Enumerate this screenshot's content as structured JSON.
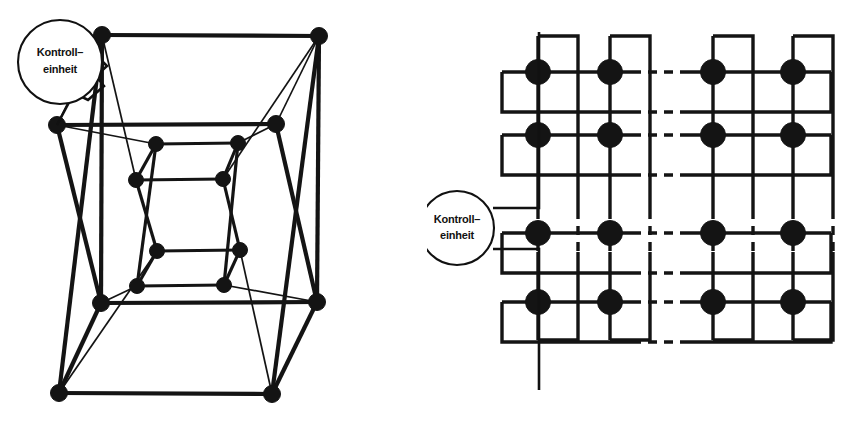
{
  "figure": {
    "background_color": "#ffffff",
    "ink_color": "#141414",
    "width": 854,
    "height": 422
  },
  "diagrams": [
    {
      "id": "hypercube",
      "name": "hypercube-diagram",
      "topology": "hypercube",
      "node_count": 16,
      "control_unit": {
        "label_line1": "Kontroll–",
        "label_line2": "einheit",
        "circle": {
          "cx": 60,
          "cy": 62,
          "r": 42
        },
        "text1": {
          "x": 60,
          "y": 53
        },
        "text2": {
          "x": 60,
          "y": 70
        },
        "leader_path": "M 98 57 L 107 66 L 96 76 L 104 86 L 88 100 L 74 93 L 57 125"
      },
      "nodes": [
        {
          "id": "o-tl",
          "x": 102,
          "y": 35,
          "r": 8.5
        },
        {
          "id": "o-tr",
          "x": 319,
          "y": 36,
          "r": 8.5
        },
        {
          "id": "o-bl",
          "x": 59,
          "y": 393,
          "r": 8.5
        },
        {
          "id": "o-br",
          "x": 272,
          "y": 394,
          "r": 8.5
        },
        {
          "id": "m-tl",
          "x": 57,
          "y": 125,
          "r": 8.5
        },
        {
          "id": "m-tr",
          "x": 276,
          "y": 124,
          "r": 8.5
        },
        {
          "id": "m-bl",
          "x": 101,
          "y": 303,
          "r": 8.5
        },
        {
          "id": "m-br",
          "x": 317,
          "y": 302,
          "r": 8.5
        },
        {
          "id": "i-tl",
          "x": 156,
          "y": 144,
          "r": 7.5
        },
        {
          "id": "i-tr",
          "x": 238,
          "y": 143,
          "r": 7.5
        },
        {
          "id": "i-bl",
          "x": 136,
          "y": 180,
          "r": 7.5
        },
        {
          "id": "i-br",
          "x": 223,
          "y": 179,
          "r": 7.5
        },
        {
          "id": "c-tl",
          "x": 157,
          "y": 251,
          "r": 7.5
        },
        {
          "id": "c-tr",
          "x": 240,
          "y": 250,
          "r": 7.5
        },
        {
          "id": "c-bl",
          "x": 137,
          "y": 286,
          "r": 7.5
        },
        {
          "id": "c-br",
          "x": 224,
          "y": 285,
          "r": 7.5
        }
      ],
      "edges_thick": [
        [
          "o-tl",
          "o-tr"
        ],
        [
          "o-tl",
          "m-bl"
        ],
        [
          "o-tr",
          "m-br"
        ],
        [
          "o-bl",
          "o-br"
        ],
        [
          "m-bl",
          "o-bl"
        ],
        [
          "m-br",
          "o-br"
        ],
        [
          "m-tl",
          "m-tr"
        ],
        [
          "m-tl",
          "m-bl"
        ],
        [
          "m-tr",
          "m-br"
        ],
        [
          "m-bl",
          "m-br"
        ],
        [
          "o-tl",
          "o-bl"
        ],
        [
          "o-tr",
          "o-br"
        ],
        [
          "i-tl",
          "i-tr"
        ],
        [
          "i-tl",
          "i-bl"
        ],
        [
          "i-tr",
          "i-br"
        ],
        [
          "i-bl",
          "i-br"
        ],
        [
          "c-tl",
          "c-tr"
        ],
        [
          "c-tl",
          "c-bl"
        ],
        [
          "c-tr",
          "c-br"
        ],
        [
          "c-bl",
          "c-br"
        ],
        [
          "i-bl",
          "c-tl"
        ],
        [
          "i-br",
          "c-tr"
        ],
        [
          "i-tl",
          "c-bl"
        ],
        [
          "i-tr",
          "c-br"
        ]
      ],
      "edges_thin": [
        [
          "o-tl",
          "i-bl"
        ],
        [
          "o-tr",
          "i-br"
        ],
        [
          "o-bl",
          "c-tl"
        ],
        [
          "o-br",
          "c-tr"
        ],
        [
          "m-tl",
          "i-tl"
        ],
        [
          "m-tr",
          "i-tr"
        ],
        [
          "m-bl",
          "c-bl"
        ],
        [
          "m-br",
          "c-br"
        ],
        [
          "o-tl",
          "m-tl"
        ],
        [
          "o-tr",
          "m-tr"
        ],
        [
          "o-bl",
          "m-bl"
        ],
        [
          "o-br",
          "m-br"
        ]
      ]
    },
    {
      "id": "torus",
      "name": "torus-diagram",
      "topology": "torus-mesh",
      "node_count": 16,
      "control_unit": {
        "label_line1": "Kontroll–",
        "label_line2": "einheit",
        "circle": {
          "cx": 30,
          "cy": 228,
          "r": 37
        },
        "text1": {
          "x": 30,
          "y": 220
        },
        "text2": {
          "x": 30,
          "y": 236
        },
        "leader_top": "M 66 208 L 112 208 L 112 32",
        "leader_bottom": "M 66 249 L 112 249 L 112 390"
      },
      "columns": [
        111,
        183,
        286,
        366
      ],
      "rows": [
        72,
        135,
        233,
        302
      ],
      "node_radius": 12.5
    }
  ]
}
